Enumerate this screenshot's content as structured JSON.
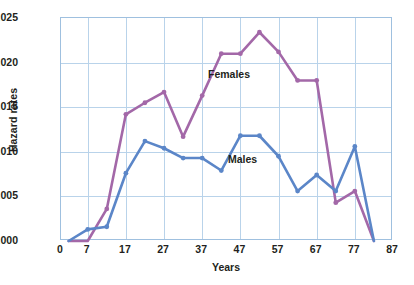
{
  "figure": {
    "background": "#ffffff",
    "frame_color": "#9fc0df",
    "grid_color": "#b9d3ea"
  },
  "chart_data": {
    "type": "line",
    "title": "",
    "xlabel": "Years",
    "ylabel": "Hazard rates",
    "xlim": [
      0,
      87
    ],
    "ylim": [
      0.0,
      0.025
    ],
    "grid": true,
    "legend_position": "inline-annotations",
    "xticks": [
      0,
      7,
      17,
      27,
      37,
      47,
      57,
      67,
      77,
      87
    ],
    "xticklabels": [
      "0",
      "7",
      "17",
      "27",
      "37",
      "47",
      "57",
      "67",
      "77",
      "87"
    ],
    "yticks": [
      0.0,
      0.005,
      0.01,
      0.015,
      0.02,
      0.025
    ],
    "yticklabels": [
      ".000",
      ".005",
      ".010",
      ".015",
      ".020",
      ".025"
    ],
    "series": [
      {
        "name": "Females",
        "color": "#a368a8",
        "x": [
          2,
          7,
          12,
          17,
          22,
          27,
          32,
          37,
          42,
          47,
          52,
          57,
          62,
          67,
          72,
          77,
          82
        ],
        "values": [
          0.0,
          0.0,
          0.0036,
          0.0142,
          0.0155,
          0.0167,
          0.0117,
          0.0163,
          0.021,
          0.021,
          0.0234,
          0.0212,
          0.018,
          0.018,
          0.0043,
          0.0056,
          0.0
        ]
      },
      {
        "name": "Males",
        "color": "#5b86c8",
        "x": [
          2,
          7,
          12,
          17,
          22,
          27,
          32,
          37,
          42,
          47,
          52,
          57,
          62,
          67,
          72,
          77,
          82
        ],
        "values": [
          0.0,
          0.0013,
          0.0016,
          0.0076,
          0.0112,
          0.0104,
          0.0093,
          0.0093,
          0.0079,
          0.0118,
          0.0118,
          0.0095,
          0.0056,
          0.0074,
          0.0056,
          0.0106,
          0.0
        ]
      }
    ],
    "annotations": [
      {
        "text": "Females",
        "x": 44,
        "y": 0.0185
      },
      {
        "text": "Males",
        "x": 49,
        "y": 0.009
      }
    ]
  }
}
